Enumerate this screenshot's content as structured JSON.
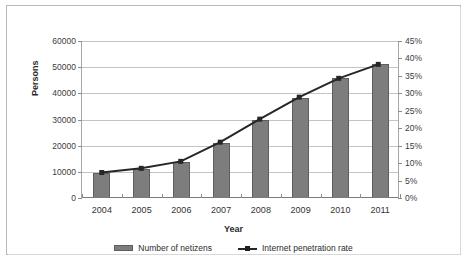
{
  "chart_data": {
    "type": "bar",
    "title": "",
    "categories": [
      "2004",
      "2005",
      "2006",
      "2007",
      "2008",
      "2009",
      "2010",
      "2011"
    ],
    "xlabel": "Year",
    "ylabel": "Persons",
    "y2label": "",
    "ylim": [
      0,
      60000
    ],
    "y2lim": [
      0,
      45
    ],
    "grid": true,
    "legend_position": "bottom",
    "y_ticks": [
      "0",
      "10000",
      "20000",
      "30000",
      "40000",
      "50000",
      "60000"
    ],
    "y_tick_values": [
      0,
      10000,
      20000,
      30000,
      40000,
      50000,
      60000
    ],
    "y2_ticks": [
      "0%",
      "5%",
      "10%",
      "15%",
      "20%",
      "25%",
      "30%",
      "35%",
      "40%",
      "45%"
    ],
    "y2_tick_values": [
      0,
      5,
      10,
      15,
      20,
      25,
      30,
      35,
      40,
      45
    ],
    "series": [
      {
        "name": "Number of netizens",
        "type": "bar",
        "axis": "left",
        "color": "#7d7d7d",
        "values": [
          9400,
          11100,
          13700,
          21000,
          29800,
          38400,
          45700,
          51300
        ]
      },
      {
        "name": "Internet penetration rate",
        "type": "line",
        "axis": "right",
        "color": "#262626",
        "unit": "%",
        "values": [
          7.3,
          8.5,
          10.5,
          16.0,
          22.6,
          28.9,
          34.3,
          38.3
        ]
      }
    ]
  },
  "legend": {
    "items": [
      {
        "label": "Number of netizens",
        "marker": "bar-swatch"
      },
      {
        "label": "Internet penetration rate",
        "marker": "line-marker-swatch"
      }
    ]
  },
  "axes": {
    "x_title": "Year",
    "y_title": "Persons"
  }
}
